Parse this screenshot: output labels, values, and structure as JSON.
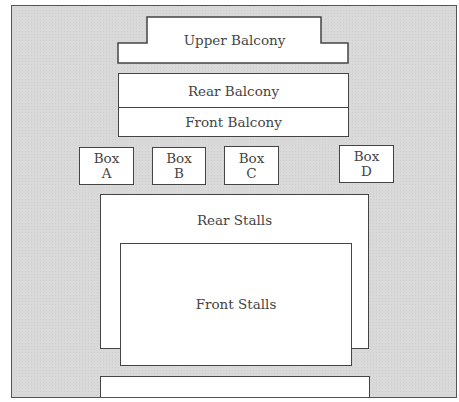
{
  "diagram": {
    "title": "",
    "colors": {
      "background": "#d9d9d9",
      "area_fill": "#ffffff",
      "stroke": "#444444"
    },
    "sections": {
      "upper_balcony": {
        "label": "Upper Balcony"
      },
      "rear_balcony": {
        "label": "Rear Balcony"
      },
      "front_balcony": {
        "label": "Front Balcony"
      },
      "boxes": [
        {
          "line1": "Box",
          "line2": "A"
        },
        {
          "line1": "Box",
          "line2": "B"
        },
        {
          "line1": "Box",
          "line2": "C"
        },
        {
          "line1": "Box",
          "line2": "D"
        }
      ],
      "rear_stalls": {
        "label": "Rear Stalls"
      },
      "front_stalls": {
        "label": "Front Stalls"
      },
      "bottom_area": {
        "label": ""
      }
    }
  }
}
